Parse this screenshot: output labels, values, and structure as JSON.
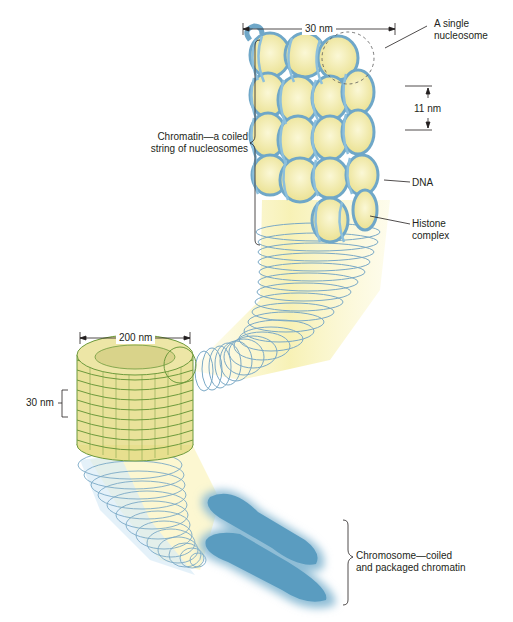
{
  "diagram": {
    "labels": {
      "width_top": "30 nm",
      "single_nucleosome": [
        "A single",
        "nucleosome"
      ],
      "height_nucleosome": "11 nm",
      "chromatin": [
        "Chromatin—a coiled",
        "string of nucleosomes"
      ],
      "dna": "DNA",
      "histone": [
        "Histone",
        "complex"
      ],
      "width_coil": "200 nm",
      "height_coil": "30 nm",
      "chromosome": [
        "Chromosome—coiled",
        "and packaged chromatin"
      ]
    },
    "colors": {
      "dna_blue": "#7fb3d1",
      "histone_yellow": "#f3eeb0",
      "coil_green": "#6d9a3c",
      "chromosome_blue": "#5a9cc0",
      "text": "#231f20"
    }
  }
}
